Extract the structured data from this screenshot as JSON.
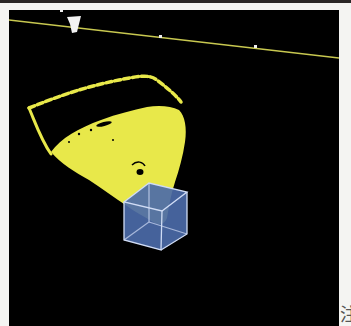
{
  "figure": {
    "type": "3d-point-cloud-view",
    "background_color": "#000000",
    "point_color": "#e8e84a",
    "box_color": "#4b6aa8",
    "box_edge_color": "#d0dcf5",
    "ground_line_color": "#c8c850",
    "marker_color": "#f0f0f0"
  },
  "margin_text": {
    "clipped_glyph": "注"
  }
}
